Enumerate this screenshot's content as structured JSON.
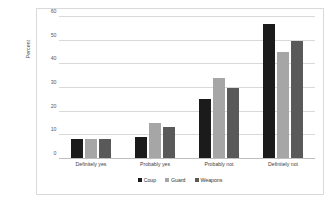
{
  "chart_data": {
    "type": "bar",
    "title": "",
    "xlabel": "",
    "ylabel": "Percent",
    "ylim": [
      0,
      60
    ],
    "yticks": [
      0,
      10,
      20,
      30,
      40,
      50,
      60
    ],
    "grid": true,
    "legend_position": "bottom",
    "categories": [
      "Definitely yes",
      "Probably yes",
      "Probably not",
      "Definitely not"
    ],
    "series": [
      {
        "name": "Coup",
        "color": "#1b1b1b",
        "values": [
          8,
          9,
          25,
          57
        ]
      },
      {
        "name": "Guard",
        "color": "#a6a6a6",
        "values": [
          8,
          15,
          34,
          45
        ]
      },
      {
        "name": "Weapons",
        "color": "#595959",
        "values": [
          8,
          13,
          30,
          50
        ]
      }
    ]
  }
}
